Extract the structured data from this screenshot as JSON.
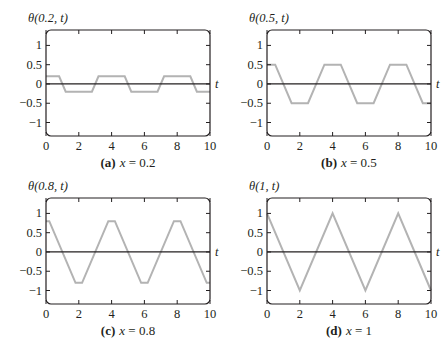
{
  "figure": {
    "colors": {
      "frame": "#231f20",
      "curve": "#b3b3b3",
      "zero_line": "#231f20",
      "background": "#ffffff"
    }
  },
  "chart_data": [
    {
      "type": "line",
      "panel_label": "(a)",
      "caption": "x = 0.2",
      "title": "θ(0.2, t)",
      "xlabel": "t",
      "ylabel": "θ(0.2, t)",
      "xlim": [
        0,
        10
      ],
      "ylim": [
        -1.35,
        1.4
      ],
      "xticks": [
        0,
        2,
        4,
        6,
        8,
        10
      ],
      "yticks": [
        1,
        0.5,
        0,
        -0.5,
        -1
      ],
      "ytick_labels": [
        "1",
        "0.5",
        "0",
        "−0.5",
        "−1"
      ],
      "grid": false,
      "legend": null,
      "series": [
        {
          "name": "θ(0.2, t)",
          "x": [
            0,
            0.8,
            1.2,
            2.8,
            3.2,
            4.8,
            5.2,
            6.8,
            7.2,
            8.8,
            9.2,
            10
          ],
          "y": [
            0.2,
            0.2,
            -0.2,
            -0.2,
            0.2,
            0.2,
            -0.2,
            -0.2,
            0.2,
            0.2,
            -0.2,
            -0.2
          ]
        }
      ]
    },
    {
      "type": "line",
      "panel_label": "(b)",
      "caption": "x = 0.5",
      "title": "θ(0.5, t)",
      "xlabel": "t",
      "ylabel": "θ(0.5, t)",
      "xlim": [
        0,
        10
      ],
      "ylim": [
        -1.35,
        1.4
      ],
      "xticks": [
        0,
        2,
        4,
        6,
        8,
        10
      ],
      "yticks": [
        1,
        0.5,
        0,
        -0.5,
        -1
      ],
      "ytick_labels": [
        "1",
        "0.5",
        "0",
        "−0.5",
        "−1"
      ],
      "grid": false,
      "legend": null,
      "series": [
        {
          "name": "θ(0.5, t)",
          "x": [
            0,
            0.5,
            1.5,
            2.5,
            3.5,
            4.5,
            5.5,
            6.5,
            7.5,
            8.5,
            9.5,
            10
          ],
          "y": [
            0.5,
            0.5,
            -0.5,
            -0.5,
            0.5,
            0.5,
            -0.5,
            -0.5,
            0.5,
            0.5,
            -0.5,
            -0.5
          ]
        }
      ]
    },
    {
      "type": "line",
      "panel_label": "(c)",
      "caption": "x = 0.8",
      "title": "θ(0.8, t)",
      "xlabel": "t",
      "ylabel": "θ(0.8, t)",
      "xlim": [
        0,
        10
      ],
      "ylim": [
        -1.35,
        1.4
      ],
      "xticks": [
        0,
        2,
        4,
        6,
        8,
        10
      ],
      "yticks": [
        1,
        0.5,
        0,
        -0.5,
        -1
      ],
      "ytick_labels": [
        "1",
        "0.5",
        "0",
        "−0.5",
        "−1"
      ],
      "grid": false,
      "legend": null,
      "series": [
        {
          "name": "θ(0.8, t)",
          "x": [
            0,
            0.2,
            1.8,
            2.2,
            3.8,
            4.2,
            5.8,
            6.2,
            7.8,
            8.2,
            9.8,
            10
          ],
          "y": [
            0.8,
            0.8,
            -0.8,
            -0.8,
            0.8,
            0.8,
            -0.8,
            -0.8,
            0.8,
            0.8,
            -0.8,
            -0.8
          ]
        }
      ]
    },
    {
      "type": "line",
      "panel_label": "(d)",
      "caption": "x = 1",
      "title": "θ(1, t)",
      "xlabel": "t",
      "ylabel": "θ(1, t)",
      "xlim": [
        0,
        10
      ],
      "ylim": [
        -1.35,
        1.4
      ],
      "xticks": [
        0,
        2,
        4,
        6,
        8,
        10
      ],
      "yticks": [
        1,
        0.5,
        0,
        -0.5,
        -1
      ],
      "ytick_labels": [
        "1",
        "0.5",
        "0",
        "−0.5",
        "−1"
      ],
      "grid": false,
      "legend": null,
      "series": [
        {
          "name": "θ(1, t)",
          "x": [
            0,
            2,
            4,
            6,
            8,
            10
          ],
          "y": [
            1,
            -1,
            1,
            -1,
            1,
            -1
          ]
        }
      ]
    }
  ]
}
